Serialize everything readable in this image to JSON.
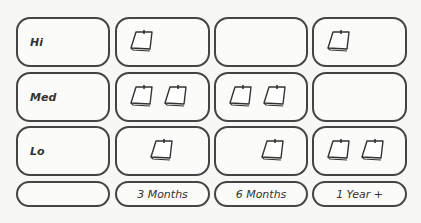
{
  "rows": [
    {
      "label": "Hi",
      "counts": [
        1,
        0,
        1
      ]
    },
    {
      "label": "Med",
      "counts": [
        2,
        2,
        0
      ]
    },
    {
      "label": "Lo",
      "counts": [
        1,
        1,
        2
      ]
    }
  ],
  "columns": [
    "",
    "3 Months",
    "6 Months",
    "1 Year +"
  ],
  "icon": "sticky-note-icon"
}
